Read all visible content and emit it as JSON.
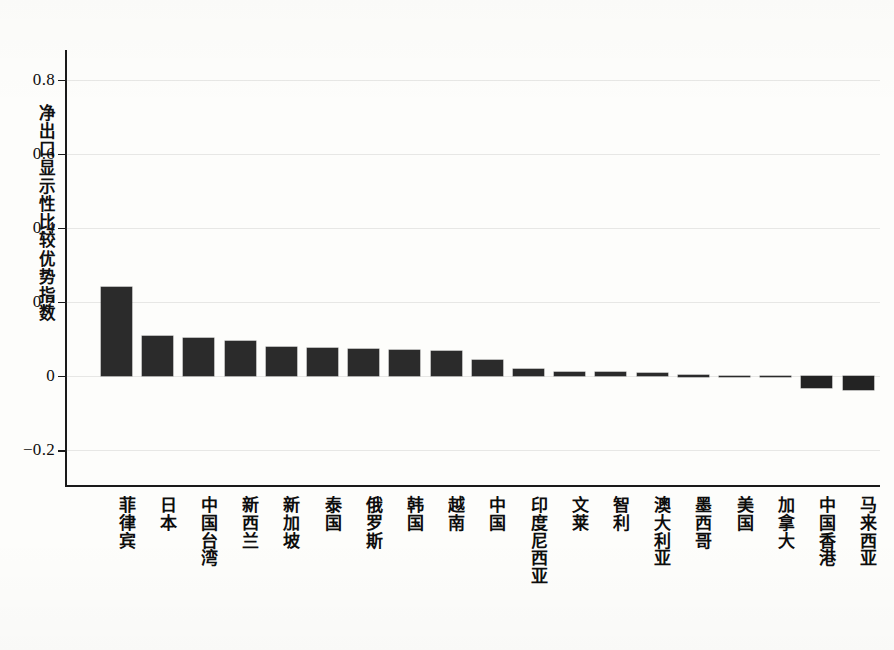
{
  "chart_data": {
    "type": "bar",
    "title": "",
    "subtitle": "",
    "xlabel": "",
    "ylabel": "净出口显示性比较优势指数",
    "ylim": [
      -0.3,
      0.88
    ],
    "yticks": [
      "0.8",
      "0.6",
      "0.4",
      "0.2",
      "0",
      "-0.2"
    ],
    "ytick_values": [
      0.8,
      0.6,
      0.4,
      0.2,
      0,
      -0.2
    ],
    "grid": true,
    "legend": "none",
    "bar_color": "#2b2b2b",
    "background_color": "#fdfdfb",
    "categories": [
      "菲律宾",
      "日本",
      "中国台湾",
      "新西兰",
      "新加坡",
      "泰国",
      "俄罗斯",
      "韩国",
      "越南",
      "中国",
      "印度尼西亚",
      "文莱",
      "智利",
      "澳大利亚",
      "墨西哥",
      "美国",
      "加拿大",
      "中国香港",
      "马来西亚"
    ],
    "values": [
      0.24,
      0.108,
      0.101,
      0.094,
      0.078,
      0.076,
      0.072,
      0.071,
      0.066,
      0.043,
      0.019,
      0.011,
      0.01,
      0.008,
      0.002,
      0.001,
      0.001,
      -0.034,
      -0.038
    ]
  }
}
